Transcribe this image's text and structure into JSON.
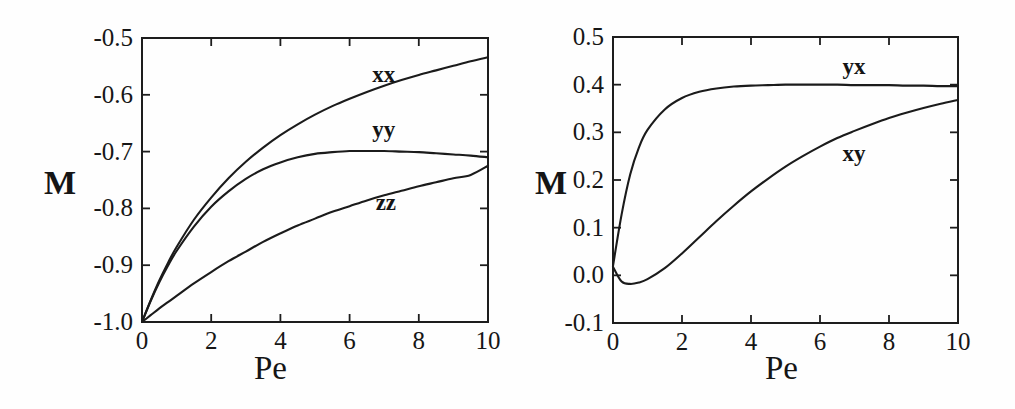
{
  "figure": {
    "background_color": "#fefefe",
    "line_color": "#1b1b1b",
    "panels": [
      "left",
      "right"
    ]
  },
  "chart_data": [
    {
      "id": "left-panel",
      "type": "line",
      "title": "",
      "xlabel": "Pe",
      "ylabel": "M",
      "xlim": [
        0,
        10
      ],
      "ylim": [
        -1.0,
        -0.5
      ],
      "grid": false,
      "legend_position": "inline-curve-labels",
      "xticks": [
        0,
        2,
        4,
        6,
        8,
        10
      ],
      "xticklabels": [
        "0",
        "2",
        "4",
        "6",
        "8",
        "10"
      ],
      "yticks": [
        -1.0,
        -0.9,
        -0.8,
        -0.7,
        -0.6,
        -0.5
      ],
      "yticklabels": [
        "-1.0",
        "-0.9",
        "-0.8",
        "-0.7",
        "-0.6",
        "-0.5"
      ],
      "x": [
        0,
        0.25,
        0.5,
        0.75,
        1.0,
        1.5,
        2.0,
        2.5,
        3.0,
        3.5,
        4.0,
        4.5,
        5.0,
        5.5,
        6.0,
        6.5,
        7.0,
        7.5,
        8.0,
        8.5,
        9.0,
        9.5,
        10.0
      ],
      "series": [
        {
          "name": "xx",
          "label": "xx",
          "values": [
            -1.0,
            -0.962,
            -0.927,
            -0.896,
            -0.868,
            -0.82,
            -0.781,
            -0.747,
            -0.718,
            -0.693,
            -0.671,
            -0.652,
            -0.635,
            -0.62,
            -0.607,
            -0.595,
            -0.584,
            -0.574,
            -0.565,
            -0.557,
            -0.549,
            -0.541,
            -0.534
          ],
          "label_x": 7.0,
          "label_y": -0.565
        },
        {
          "name": "yy",
          "label": "yy",
          "values": [
            -1.0,
            -0.963,
            -0.93,
            -0.901,
            -0.875,
            -0.832,
            -0.797,
            -0.77,
            -0.748,
            -0.731,
            -0.719,
            -0.71,
            -0.704,
            -0.701,
            -0.699,
            -0.699,
            -0.699,
            -0.7,
            -0.701,
            -0.703,
            -0.705,
            -0.707,
            -0.71
          ],
          "label_x": 7.0,
          "label_y": -0.662
        },
        {
          "name": "zz",
          "label": "zz",
          "values": [
            -1.0,
            -0.988,
            -0.976,
            -0.965,
            -0.954,
            -0.932,
            -0.912,
            -0.893,
            -0.876,
            -0.859,
            -0.844,
            -0.83,
            -0.818,
            -0.806,
            -0.796,
            -0.786,
            -0.777,
            -0.769,
            -0.761,
            -0.754,
            -0.747,
            -0.741,
            -0.725
          ],
          "label_x": 7.1,
          "label_y": -0.79
        }
      ]
    },
    {
      "id": "right-panel",
      "type": "line",
      "title": "",
      "xlabel": "Pe",
      "ylabel": "M",
      "xlim": [
        0,
        10
      ],
      "ylim": [
        -0.1,
        0.5
      ],
      "grid": false,
      "legend_position": "inline-curve-labels",
      "xticks": [
        0,
        2,
        4,
        6,
        8,
        10
      ],
      "xticklabels": [
        "0",
        "2",
        "4",
        "6",
        "8",
        "10"
      ],
      "yticks": [
        -0.1,
        0.0,
        0.1,
        0.2,
        0.3,
        0.4,
        0.5
      ],
      "yticklabels": [
        "-0.1",
        "0.0",
        "0.1",
        "0.2",
        "0.3",
        "0.4",
        "0.5"
      ],
      "x": [
        0,
        0.25,
        0.5,
        0.75,
        1.0,
        1.5,
        2.0,
        2.5,
        3.0,
        3.5,
        4.0,
        4.5,
        5.0,
        5.5,
        6.0,
        6.5,
        7.0,
        7.5,
        8.0,
        8.5,
        9.0,
        9.5,
        10.0
      ],
      "series": [
        {
          "name": "yx",
          "label": "yx",
          "values": [
            0.02,
            0.128,
            0.212,
            0.268,
            0.305,
            0.348,
            0.372,
            0.385,
            0.392,
            0.396,
            0.398,
            0.399,
            0.4,
            0.4,
            0.4,
            0.4,
            0.399,
            0.399,
            0.399,
            0.398,
            0.398,
            0.397,
            0.397
          ],
          "label_x": 7.0,
          "label_y": 0.438
        },
        {
          "name": "xy",
          "label": "xy",
          "values": [
            0.018,
            -0.013,
            -0.018,
            -0.015,
            -0.008,
            0.015,
            0.046,
            0.08,
            0.114,
            0.146,
            0.176,
            0.203,
            0.228,
            0.25,
            0.27,
            0.288,
            0.303,
            0.317,
            0.33,
            0.341,
            0.351,
            0.36,
            0.368
          ],
          "label_x": 7.0,
          "label_y": 0.255
        }
      ]
    }
  ]
}
